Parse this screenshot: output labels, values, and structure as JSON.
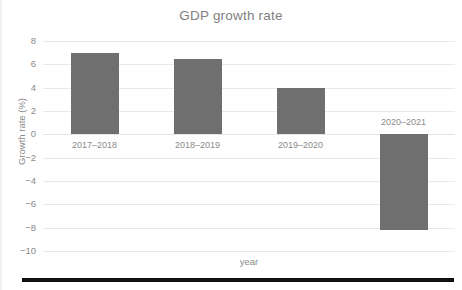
{
  "chart_data": {
    "type": "bar",
    "title": "GDP growth rate",
    "xlabel": "year",
    "ylabel": "Growth rate (%)",
    "categories": [
      "2017–2018",
      "2018–2019",
      "2019–2020",
      "2020–2021"
    ],
    "values": [
      7.0,
      6.5,
      4.0,
      -8.2
    ],
    "ylim": [
      -10,
      8
    ],
    "yticks": [
      8,
      6,
      4,
      2,
      0,
      -2,
      -4,
      -6,
      -8,
      -10
    ],
    "ytick_labels": [
      "8",
      "6",
      "4",
      "2",
      "0",
      "−2",
      "−4",
      "−6",
      "−8",
      "−10"
    ],
    "grid": true,
    "legend": false,
    "series": [
      {
        "name": "GDP growth rate",
        "values": [
          7.0,
          6.5,
          4.0,
          -8.2
        ]
      }
    ],
    "colors": {
      "bar": "#6f6f6f",
      "gridline": "#e9e9e9",
      "text": "#8a8a8a",
      "title": "#7f7f7f",
      "rule": "#111111",
      "background": "#ffffff"
    }
  }
}
